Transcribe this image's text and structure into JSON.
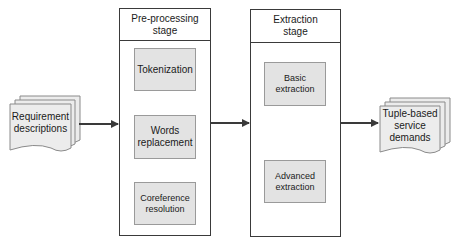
{
  "diagram": {
    "inputs": [
      {
        "id": "req",
        "label": "Requirement\ndescriptions"
      }
    ],
    "outputs": [
      {
        "id": "tuple",
        "label": "Tuple-based\nservice\ndemands"
      }
    ],
    "stages": [
      {
        "id": "preprocessing",
        "title": "Pre-processing\nstage",
        "steps": [
          {
            "id": "tokenization",
            "label": "Tokenization"
          },
          {
            "id": "words-replacement",
            "label": "Words\nreplacement"
          },
          {
            "id": "coreference-resolution",
            "label": "Coreference\nresolution"
          }
        ]
      },
      {
        "id": "extraction",
        "title": "Extraction\nstage",
        "steps": [
          {
            "id": "basic-extraction",
            "label": "Basic\nextraction"
          },
          {
            "id": "advanced-extraction",
            "label": "Advanced\nextraction"
          }
        ]
      }
    ],
    "edges": [
      {
        "from": "req",
        "to": "preprocessing"
      },
      {
        "from": "tokenization",
        "to": "words-replacement"
      },
      {
        "from": "words-replacement",
        "to": "coreference-resolution"
      },
      {
        "from": "preprocessing",
        "to": "extraction"
      },
      {
        "from": "basic-extraction",
        "to": "advanced-extraction"
      },
      {
        "from": "extraction",
        "to": "tuple"
      }
    ],
    "colors": {
      "step_fill": "#e3e3e3",
      "step_border": "#9a9a9a",
      "stage_border": "#3a3a3a",
      "doc_fill": "#ececec",
      "arrow": "#3a3a3a"
    }
  }
}
